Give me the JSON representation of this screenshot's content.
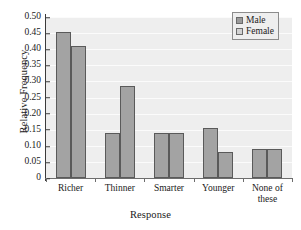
{
  "chart_data": {
    "type": "bar",
    "title": "",
    "xlabel": "Response",
    "ylabel": "Relative Frequency",
    "categories": [
      "Richer",
      "Thinner",
      "Smarter",
      "Younger",
      "None of\nthese"
    ],
    "series": [
      {
        "name": "Male",
        "values": [
          0.455,
          0.14,
          0.14,
          0.155,
          0.09
        ]
      },
      {
        "name": "Female",
        "values": [
          0.41,
          0.285,
          0.14,
          0.08,
          0.09
        ]
      }
    ],
    "ylim": [
      0,
      0.5
    ],
    "ytick_labels": [
      "0.50",
      "0.45",
      "0.40",
      "0.35",
      "0.30",
      "0.25",
      "0.20",
      "0.15",
      "0.10",
      "0.05",
      "0"
    ],
    "ytick_values": [
      0.5,
      0.45,
      0.4,
      0.35,
      0.3,
      0.25,
      0.2,
      0.15,
      0.1,
      0.05,
      0
    ],
    "grid": true,
    "legend_position": "top-right",
    "colors": {
      "male_fill": "#a3a3a3",
      "female_fill": "#a3a3a3",
      "legend_male_swatch": "#9a9a9a",
      "legend_female_swatch": "#d2d2d2",
      "bar_border": "#5a5a5a",
      "plot_background": "#eeeeee",
      "gridline": "#fbfbfb",
      "axis": "#3b3b3b",
      "page_background": "#ffffff"
    }
  },
  "legend": {
    "items": [
      {
        "label": "Male"
      },
      {
        "label": "Female"
      }
    ]
  }
}
